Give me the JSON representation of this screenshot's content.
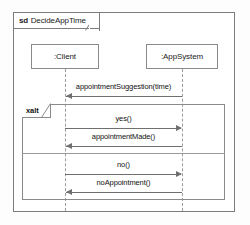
{
  "diagram": {
    "kind": "uml-sequence-diagram",
    "frame": {
      "keyword": "sd",
      "name": "DecideAppTime"
    },
    "lifelines": [
      {
        "id": "client",
        "label": ":Client"
      },
      {
        "id": "appsystem",
        "label": ":AppSystem"
      }
    ],
    "messages": [
      {
        "id": "appointment-suggestion",
        "label": "appointmentSuggestion(time)",
        "from": "appsystem",
        "to": "client",
        "direction": "left"
      },
      {
        "id": "yes",
        "label": "yes()",
        "from": "client",
        "to": "appsystem",
        "direction": "right"
      },
      {
        "id": "appointment-made",
        "label": "appointmentMade()",
        "from": "appsystem",
        "to": "client",
        "direction": "left"
      },
      {
        "id": "no",
        "label": "no()",
        "from": "client",
        "to": "appsystem",
        "direction": "right"
      },
      {
        "id": "no-appointment",
        "label": "noAppointment()",
        "from": "appsystem",
        "to": "client",
        "direction": "left"
      }
    ],
    "fragment": {
      "operator": "xalt",
      "compartments": [
        {
          "id": "compartment-1",
          "messages": [
            "yes",
            "appointment-made"
          ]
        },
        {
          "id": "compartment-2",
          "messages": [
            "no",
            "no-appointment"
          ]
        }
      ]
    },
    "colors": {
      "frame_border": "#7d7d7d",
      "box_border": "#8a8a8a",
      "message_line": "#6f6f6f",
      "lifeline_stem": "#9a9a9a",
      "text": "#111111",
      "background": "#fdfdfd"
    }
  }
}
